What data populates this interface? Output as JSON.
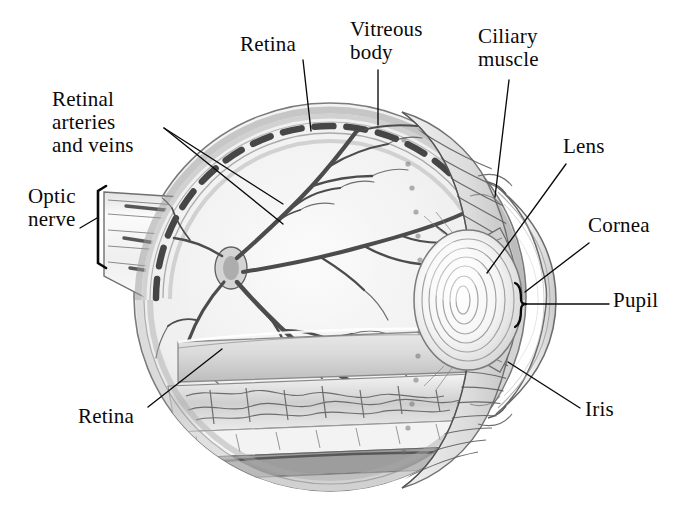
{
  "figure": {
    "style": "pencil-shaded anatomical illustration, grayscale",
    "background_color": "#ffffff",
    "ink_color": "#0a0a0a",
    "width": 691,
    "height": 515
  },
  "labels": [
    {
      "id": "retina-top",
      "text": "Retina",
      "x": 240,
      "y": 33,
      "align": "left",
      "lines": 1,
      "leader": {
        "type": "line",
        "x1": 303,
        "y1": 60,
        "x2": 311,
        "y2": 131
      }
    },
    {
      "id": "vitreous-body",
      "text": "Vitreous\nbody",
      "x": 350,
      "y": 18,
      "align": "left",
      "lines": 2,
      "leader": {
        "type": "line",
        "x1": 378,
        "y1": 70,
        "x2": 378,
        "y2": 125
      }
    },
    {
      "id": "ciliary-muscle",
      "text": "Ciliary\nmuscle",
      "x": 478,
      "y": 25,
      "align": "left",
      "lines": 2,
      "leader": {
        "type": "line",
        "x1": 509,
        "y1": 80,
        "x2": 495,
        "y2": 197
      }
    },
    {
      "id": "retinal-arteries-and-veins",
      "text": "Retinal\narteries\nand veins",
      "x": 52,
      "y": 88,
      "align": "left",
      "lines": 3,
      "leader": {
        "type": "double-line",
        "x1": 164,
        "y1": 128,
        "x2": 283,
        "y2": 204,
        "x3": 164,
        "y3": 128,
        "x4": 283,
        "y4": 224
      }
    },
    {
      "id": "optic-nerve",
      "text": "Optic\nnerve",
      "x": 28,
      "y": 185,
      "align": "left",
      "lines": 2,
      "leader": {
        "type": "line",
        "x1": 80,
        "y1": 228,
        "x2": 97,
        "y2": 218
      },
      "bracket": {
        "type": "square-bracket",
        "x": 98,
        "y_top": 186,
        "y_bottom": 268
      }
    },
    {
      "id": "lens",
      "text": "Lens",
      "x": 563,
      "y": 135,
      "align": "left",
      "lines": 1,
      "leader": {
        "type": "line",
        "x1": 566,
        "y1": 164,
        "x2": 487,
        "y2": 273
      }
    },
    {
      "id": "cornea",
      "text": "Cornea",
      "x": 588,
      "y": 214,
      "align": "left",
      "lines": 1,
      "leader": {
        "type": "line",
        "x1": 589,
        "y1": 243,
        "x2": 525,
        "y2": 292
      }
    },
    {
      "id": "pupil",
      "text": "Pupil",
      "x": 613,
      "y": 289,
      "align": "left",
      "lines": 1,
      "leader": {
        "type": "line",
        "x1": 609,
        "y1": 304,
        "x2": 527,
        "y2": 304
      },
      "bracket": {
        "type": "curly-brace",
        "x": 519,
        "y_top": 283,
        "y_bottom": 327
      }
    },
    {
      "id": "iris",
      "text": "Iris",
      "x": 585,
      "y": 398,
      "align": "left",
      "lines": 1,
      "leader": {
        "type": "line",
        "x1": 580,
        "y1": 408,
        "x2": 508,
        "y2": 362
      }
    },
    {
      "id": "retina-bottom",
      "text": "Retina",
      "x": 78,
      "y": 405,
      "align": "left",
      "lines": 1,
      "leader": {
        "type": "line",
        "x1": 148,
        "y1": 407,
        "x2": 222,
        "y2": 349
      }
    }
  ],
  "anatomy": {
    "globe": {
      "name": "eyeball",
      "center_x": 330,
      "center_y": 297,
      "radius_x": 196,
      "radius_y": 194
    },
    "structures": [
      {
        "name": "sclera",
        "description": "outer white fibrous coat forming the globe wall"
      },
      {
        "name": "choroid",
        "description": "dark pigmented vascular layer, drawn as dashed band"
      },
      {
        "name": "retina",
        "description": "inner light-sensitive layer with branching vessels"
      },
      {
        "name": "vitreous-body",
        "description": "clear gel filling the posterior chamber"
      },
      {
        "name": "optic-nerve",
        "description": "striated nerve stalk exiting posteriorly to the left"
      },
      {
        "name": "optic-disc",
        "description": "point where retinal vessels converge and exit"
      },
      {
        "name": "retinal-vessels",
        "description": "arteries and veins radiating over the retina"
      },
      {
        "name": "ciliary-muscle",
        "description": "radially striated ring anterior to the globe"
      },
      {
        "name": "ciliary-body",
        "description": "ring supporting the lens via zonules"
      },
      {
        "name": "lens",
        "description": "concentric biconvex transparent body"
      },
      {
        "name": "iris",
        "description": "pigmented diaphragm anterior to the lens"
      },
      {
        "name": "pupil",
        "description": "central aperture in the iris"
      },
      {
        "name": "cornea",
        "description": "transparent anterior dome"
      },
      {
        "name": "anterior-chamber",
        "description": "space between cornea and iris"
      }
    ]
  }
}
